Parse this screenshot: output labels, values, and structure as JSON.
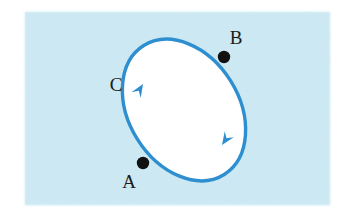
{
  "figure": {
    "name": "closed-orbit-path-diagram",
    "panel": {
      "background_color": "#cdeaf5",
      "x": 25,
      "y": 12,
      "width": 305,
      "height": 193
    },
    "page_background_color": "#ffffff",
    "curve": {
      "name": "ellipse-path",
      "stroke_color": "#2e8fd0",
      "fill_color": "#ffffff",
      "stroke_width": 3.4,
      "center_x": 184,
      "center_y": 110,
      "radius_x": 55,
      "radius_y": 76,
      "rotation_degrees": -32
    },
    "points": [
      {
        "id": "point-b",
        "label": "B",
        "dot_color": "#111111",
        "dot_radius": 6.2,
        "dot_x": 224,
        "dot_y": 57,
        "label_x": 236,
        "label_y": 44,
        "label_font_size": 19
      },
      {
        "id": "point-a",
        "label": "A",
        "dot_color": "#111111",
        "dot_radius": 6.2,
        "dot_x": 143,
        "dot_y": 163,
        "label_x": 129,
        "label_y": 188,
        "label_font_size": 19
      }
    ],
    "annotations": [
      {
        "id": "label-c",
        "label": "C",
        "label_x": 116,
        "label_y": 91,
        "label_font_size": 19,
        "color": "#1c1c1c"
      }
    ],
    "arrows": [
      {
        "id": "direction-arrow-upper-left",
        "color": "#2e8fd0",
        "tip_x": 143,
        "tip_y": 84,
        "direction_degrees": -58,
        "size": 13
      },
      {
        "id": "direction-arrow-lower-right",
        "color": "#2e8fd0",
        "tip_x": 222,
        "tip_y": 145,
        "direction_degrees": 124,
        "size": 13
      }
    ]
  }
}
